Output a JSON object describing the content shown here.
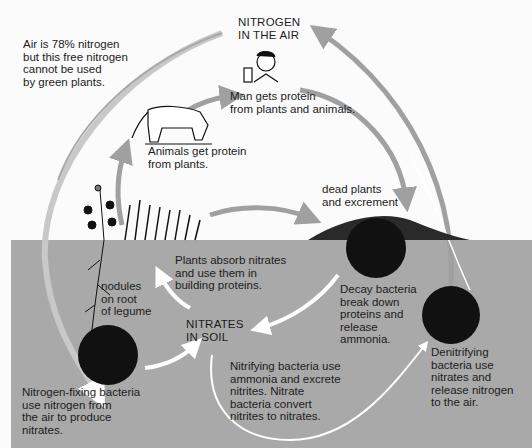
{
  "diagram": {
    "colors": {
      "background": "#fbfbfb",
      "soil": "#a9a9a9",
      "arrow_air": "#a0a0a0",
      "arrow_soil": "#ffffff",
      "bacteria": "#111111",
      "text": "#1c1c1c"
    },
    "nodes": {
      "nitrogen_air": "NITROGEN\nIN THE AIR",
      "air_note": "Air  is 78% nitrogen\nbut this free nitrogen\ncannot be used\nby green plants.",
      "man": "Man gets protein\nfrom plants and animals.",
      "animals": "Animals get protein\nfrom plants.",
      "dead": "dead plants\nand excrement",
      "plants_absorb": "Plants absorb nitrates\nand use them in\nbuilding proteins.",
      "nodules": "nodules\non root\nof legume",
      "nitrates_soil": "NITRATES\nIN SOIL",
      "decay": "Decay bacteria\nbreak down\nproteins and\nrelease\nammonia.",
      "nitrifying": "Nitrifying bacteria use\nammonia and excrete\nnitrites. Nitrate\nbacteria convert\nnitrites to nitrates.",
      "denitrifying": "Denitrifying\nbacteria use\nnitrates and\nrelease nitrogen\nto the air.",
      "fixing": "Nitrogen-fixing bacteria\nuse nitrogen from\nthe air to produce\nnitrates."
    },
    "icons": [
      "cow-icon",
      "man-icon",
      "legume-plant-icon",
      "grass-icon",
      "decay-mound-icon",
      "bacteria-circle-icon"
    ]
  }
}
